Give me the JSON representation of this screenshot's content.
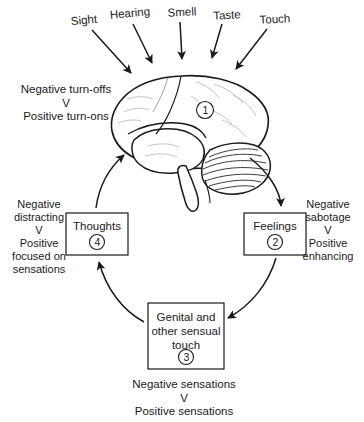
{
  "figure": {
    "stroke_color": "#1a1a1a",
    "fill_color": "#ffffff"
  },
  "senses": [
    {
      "id": "sight",
      "label": "Sight"
    },
    {
      "id": "hearing",
      "label": "Hearing"
    },
    {
      "id": "smell",
      "label": "Smell"
    },
    {
      "id": "taste",
      "label": "Taste"
    },
    {
      "id": "touch",
      "label": "Touch"
    }
  ],
  "brain": {
    "marker": "1",
    "side_label": "Negative turn-offs\nV\nPositive turn-ons"
  },
  "nodes": {
    "feelings": {
      "label": "Feelings",
      "marker": "2",
      "side_label": "Negative\nsabotage\nV\nPositive\nenhancing"
    },
    "touch": {
      "label": "Genital and\nother sensual\ntouch",
      "marker": "3",
      "side_label": "Negative sensations\nV\nPositive sensations"
    },
    "thoughts": {
      "label": "Thoughts",
      "marker": "4",
      "side_label": "Negative\ndistracting\nV\nPositive\nfocused on\nsensations"
    }
  }
}
